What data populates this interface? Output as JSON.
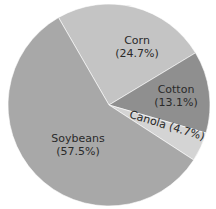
{
  "chart_data": {
    "type": "pie",
    "title": "",
    "categories": [
      "Corn",
      "Cotton",
      "Canola",
      "Soybeans"
    ],
    "values": [
      24.7,
      13.1,
      4.7,
      57.5
    ],
    "unit": "%",
    "colors": [
      "#c4c4c4",
      "#8f8f8f",
      "#d4d4d4",
      "#a8a8a8"
    ],
    "labels": [
      {
        "name": "Corn",
        "pct": "(24.7%)"
      },
      {
        "name": "Cotton",
        "pct": "(13.1%)"
      },
      {
        "name": "Canola (4.7%)",
        "pct": ""
      },
      {
        "name": "Soybeans",
        "pct": "(57.5%)"
      }
    ],
    "start_angle_deg": -30,
    "legend": "none"
  }
}
